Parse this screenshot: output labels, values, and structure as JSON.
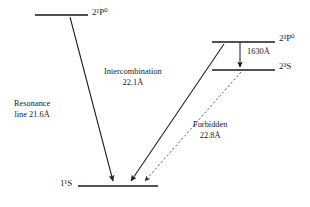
{
  "figure": {
    "kind": "grotrian-energy-level-diagram"
  },
  "levels": [
    {
      "id": "2p1",
      "label": "2¹P⁰",
      "base": "2",
      "sup_left": "1",
      "term": "P",
      "sup_right": "o",
      "x1": 35,
      "x2": 88,
      "y": 15
    },
    {
      "id": "2p3",
      "label": "2³P⁰",
      "base": "2",
      "sup_left": "3",
      "term": "P",
      "sup_right": "o",
      "x1": 212,
      "x2": 275,
      "y": 42
    },
    {
      "id": "2s3",
      "label": "2³S",
      "base": "2",
      "sup_left": "3",
      "term": "S",
      "sup_right": "",
      "x1": 212,
      "x2": 275,
      "y": 70
    },
    {
      "id": "1s1",
      "label": "1¹S",
      "base": "1",
      "sup_left": "1",
      "term": "S",
      "sup_right": "",
      "x1": 78,
      "x2": 158,
      "y": 186
    }
  ],
  "transitions": [
    {
      "id": "resonance",
      "name_line1": "Resonance",
      "name_line2": "line 21.6Å",
      "wavelength": "21.6Å",
      "style": "solid",
      "from": "2p1",
      "to": "1s1",
      "x1": 70,
      "y1": 17,
      "x2": 113,
      "y2": 183
    },
    {
      "id": "intercombination",
      "name_line1": "Intercombination",
      "name_line2": "22.1Å",
      "wavelength": "22.1Å",
      "style": "solid",
      "from": "2p3",
      "to": "1s1",
      "x1": 224,
      "y1": 44,
      "x2": 129,
      "y2": 183
    },
    {
      "id": "forbidden",
      "name_line1": "Forbidden",
      "name_line2": "22.8Å",
      "wavelength": "22.8Å",
      "style": "dashed",
      "from": "2s3",
      "to": "1s1",
      "x1": 240,
      "y1": 72,
      "x2": 142,
      "y2": 184
    },
    {
      "id": "intrashell-1630",
      "name_line1": "1630Å",
      "name_line2": "",
      "wavelength": "1630Å",
      "style": "solid-vertical",
      "from": "2p3",
      "to": "2s3",
      "x1": 240,
      "y1": 42,
      "x2": 240,
      "y2": 70
    }
  ],
  "colors": {
    "ink": "#1a1a1a",
    "dashed_ink": "#555555",
    "background": "#ffffff"
  }
}
